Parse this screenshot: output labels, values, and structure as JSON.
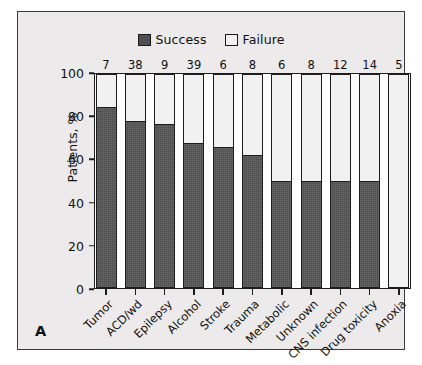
{
  "panel_label": "A",
  "legend": {
    "entries": [
      {
        "label": "Success",
        "swatch": "success",
        "color": "#4e4e4e"
      },
      {
        "label": "Failure",
        "swatch": "failure",
        "color": "#f1f1f1"
      }
    ]
  },
  "chart_data": {
    "type": "bar",
    "subtype": "stacked-bar-100-percent",
    "title": "",
    "xlabel": "",
    "ylabel": "Patients, %",
    "ylim": [
      0,
      100
    ],
    "yticks": [
      0,
      20,
      40,
      60,
      80,
      100
    ],
    "ytick_labels": [
      "0",
      "20",
      "40",
      "60",
      "80",
      "100"
    ],
    "grid": false,
    "legend_position": "top-center",
    "categories": [
      "Tumor",
      "ACD/wd",
      "Epilepsy",
      "Alcohol",
      "Stroke",
      "Trauma",
      "Metabolic",
      "Unknown",
      "CNS infection",
      "Drug toxicity",
      "Anoxia"
    ],
    "series": [
      {
        "name": "Success",
        "color": "#4e4e4e",
        "values": [
          85,
          78,
          77,
          68,
          66,
          62,
          50,
          50,
          50,
          50,
          0
        ]
      },
      {
        "name": "Failure",
        "color": "#f1f1f1",
        "values": [
          15,
          22,
          23,
          32,
          34,
          38,
          50,
          50,
          50,
          50,
          100
        ]
      }
    ],
    "bar_annotations": {
      "label": "n",
      "position": "above-bar",
      "values": [
        7,
        38,
        9,
        39,
        6,
        8,
        6,
        8,
        12,
        14,
        5
      ]
    }
  }
}
